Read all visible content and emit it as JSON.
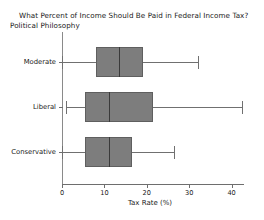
{
  "chart_data": {
    "type": "box",
    "title": "What Percent of Income Should Be Paid in Federal Income Tax?",
    "subtitle": "Political Philosophy",
    "xlabel": "Tax Rate (%)",
    "ylabel": "",
    "orientation": "horizontal",
    "xlim": [
      0,
      41.5
    ],
    "xticks": [
      0,
      10,
      20,
      30,
      40
    ],
    "xticklabels": [
      "0",
      "10",
      "20",
      "30",
      "40"
    ],
    "grid": false,
    "legend": "none",
    "categories": [
      "Moderate",
      "Liberal",
      "Conservative"
    ],
    "boxes": [
      {
        "category": "Moderate",
        "whisker_low": 0.0,
        "q1": 8.0,
        "median": 13.5,
        "q3": 19.0,
        "whisker_high": 32.0
      },
      {
        "category": "Liberal",
        "whisker_low": 1.0,
        "q1": 5.5,
        "median": 11.0,
        "q3": 21.5,
        "whisker_high": 42.5
      },
      {
        "category": "Conservative",
        "whisker_low": 0.0,
        "q1": 5.5,
        "median": 11.0,
        "q3": 16.5,
        "whisker_high": 26.5
      }
    ],
    "colors": {
      "box_fill": "#7d7d7d",
      "box_edge": "#5f5f5f",
      "median": "#3a3a3a",
      "whisker": "#707070",
      "axis": "#6e6e6e",
      "text": "#1a1a1a",
      "background": "#ffffff"
    }
  }
}
